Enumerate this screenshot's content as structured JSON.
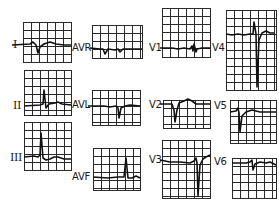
{
  "figure": {
    "colors": {
      "grid": "#2a2a2a",
      "trace": "#111111",
      "background": "#ffffff"
    },
    "leads": [
      {
        "id": "I",
        "label": "I",
        "box": [
          23,
          22,
          48,
          40
        ],
        "label_pos": [
          13,
          40
        ],
        "baseline": 45,
        "trace": "M12,45 L30,44 L33,42 L36,45 L38,53 L40,47 L44,44 L50,42 L56,44 L64,45 L71,45"
      },
      {
        "id": "aVR",
        "label": "AVR",
        "box": [
          92,
          25,
          50,
          33
        ],
        "label_pos": [
          72,
          43
        ],
        "baseline": 49,
        "trace": "M90,48 L100,49 L103,49 L105,54 L108,49 L115,50 L118,49 L120,52 L123,49 L135,49 L142,49"
      },
      {
        "id": "II",
        "label": "II",
        "box": [
          24,
          70,
          47,
          45
        ],
        "label_pos": [
          13,
          101
        ],
        "baseline": 106,
        "trace": "M24,106 L40,105 L43,104 L44,90 L46,108 L49,104 L55,103 L58,102 L62,104 L71,105"
      },
      {
        "id": "aVL",
        "label": "AVL",
        "box": [
          92,
          90,
          48,
          35
        ],
        "label_pos": [
          72,
          100
        ],
        "baseline": 106,
        "trace": "M88,106 L104,106 L110,107 L116,106 L118,108 L119,118 L121,108 L125,106 L130,105 L140,106"
      },
      {
        "id": "III",
        "label": "III",
        "box": [
          24,
          122,
          47,
          48
        ],
        "label_pos": [
          10,
          153
        ],
        "baseline": 158,
        "trace": "M24,157 L34,156 L38,157 L40,155 L41,133 L43,158 L46,160 L50,159 L54,157 L58,157 L64,159 L71,159"
      },
      {
        "id": "aVF",
        "label": "AVF",
        "box": [
          93,
          148,
          47,
          42
        ],
        "label_pos": [
          72,
          172
        ],
        "baseline": 178,
        "trace": "M93,177 L108,178 L118,177 L124,177 L126,158 L128,178 L132,178 L136,176 L140,178"
      },
      {
        "id": "V1",
        "label": "V1",
        "box": [
          162,
          8,
          48,
          49
        ],
        "label_pos": [
          149,
          43
        ],
        "baseline": 48,
        "trace": "M160,48 L172,48 L178,49 L184,48 L190,49 L192,46 L193,51 L194,44 L196,52 L197,49 L202,48 L210,48"
      },
      {
        "id": "V4",
        "label": "V4",
        "box": [
          226,
          10,
          50,
          80
        ],
        "label_pos": [
          212,
          43
        ],
        "baseline": 34,
        "trace": "M226,34 L232,35 L238,34 L244,35 L250,34 L253,34 L254,22 L256,34 L257,87 L259,40 L262,33 L266,31 L270,33 L274,33"
      },
      {
        "id": "V2",
        "label": "V2",
        "box": [
          163,
          100,
          47,
          28
        ],
        "label_pos": [
          149,
          100
        ],
        "baseline": 104,
        "trace": "M160,104 L168,104 L172,104 L174,110 L175,122 L177,110 L179,103 L184,101 L188,99 L192,101 L196,104 L210,104"
      },
      {
        "id": "V5",
        "label": "V5",
        "box": [
          230,
          100,
          46,
          43
        ],
        "label_pos": [
          214,
          101
        ],
        "baseline": 112,
        "trace": "M230,112 L236,111 L238,108 L239,113 L240,132 L242,116 L246,112 L252,110 L260,112 L268,112 L276,112"
      },
      {
        "id": "V3",
        "label": "V3",
        "box": [
          162,
          140,
          48,
          58
        ],
        "label_pos": [
          149,
          155
        ],
        "baseline": 160,
        "trace": "M160,160 L170,162 L180,162 L190,163 L194,161 L196,158 L197,163 L198,196 L200,165 L203,159 L206,157 L210,155"
      },
      {
        "id": "V6",
        "label": "V6",
        "box": [
          232,
          158,
          44,
          40
        ],
        "label_pos": [
          214,
          157
        ],
        "baseline": 163,
        "trace": "M232,163 L240,163 L246,163 L250,162 L252,160 L253,170 L255,164 L260,162 L266,163 L270,162 L276,165"
      }
    ]
  }
}
